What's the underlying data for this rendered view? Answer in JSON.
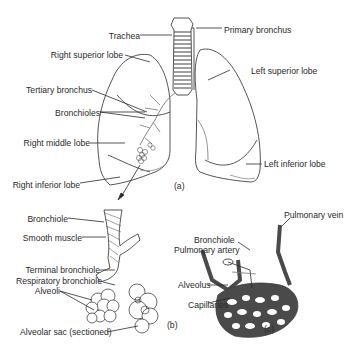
{
  "figure": {
    "panels": {
      "a": "(a)",
      "b": "(b)",
      "c": "(c)"
    },
    "labels": {
      "trachea": "Trachea",
      "primary_bronchus": "Primary bronchus",
      "right_superior_lobe": "Right superior lobe",
      "left_superior_lobe": "Left superior lobe",
      "tertiary_bronchus": "Tertiary bronchus",
      "bronchioles": "Bronchioles",
      "right_middle_lobe": "Right middle lobe",
      "left_inferior_lobe": "Left inferior lobe",
      "right_inferior_lobe": "Right inferior lobe",
      "bronchiole_b": "Bronchiole",
      "smooth_muscle": "Smooth muscle",
      "terminal_bronchiole": "Terminal bronchiole",
      "respiratory_bronchiole": "Respiratory bronchiole",
      "alveoli": "Alveoli",
      "alveolar_sac": "Alveolar sac (sectioned)",
      "bronchiole_c": "Bronchiole",
      "pulmonary_vein": "Pulmonary vein",
      "pulmonary_artery": "Pulmonary artery",
      "alveolus": "Alveolus",
      "capillaries": "Capillaries"
    },
    "colors": {
      "line": "#2a2a2a",
      "vessel": "#4a4a4a",
      "background": "#ffffff"
    }
  }
}
